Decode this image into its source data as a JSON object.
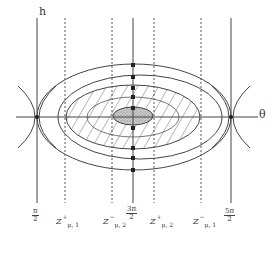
{
  "figure": {
    "axes": {
      "vertical_label": "h",
      "horizontal_label": "θ"
    },
    "ticks": [
      {
        "id": "pi-half",
        "num": "π",
        "den": "2",
        "x": 37
      },
      {
        "id": "three-pi-half",
        "num": "3π",
        "den": "2",
        "x": 133
      },
      {
        "id": "five-pi-half",
        "num": "5π",
        "den": "2",
        "x": 231
      }
    ],
    "dashed_lines": [
      {
        "id": "z-plus-mu1",
        "base": "Z",
        "sup": "+",
        "sub": "μ, 1",
        "x": 65
      },
      {
        "id": "z-minus-mu2",
        "base": "Z",
        "sup": "−",
        "sub": "μ, 2",
        "x": 112
      },
      {
        "id": "z-plus-mu2",
        "base": "Z",
        "sup": "+",
        "sub": "μ, 2",
        "x": 154
      },
      {
        "id": "z-minus-mu1",
        "base": "Z",
        "sup": "−",
        "sub": "μ, 1",
        "x": 201
      }
    ],
    "colors": {
      "line": "#444444",
      "hatch": "#555555",
      "core_fill": "#bdbdbd",
      "background": "#ffffff"
    }
  }
}
